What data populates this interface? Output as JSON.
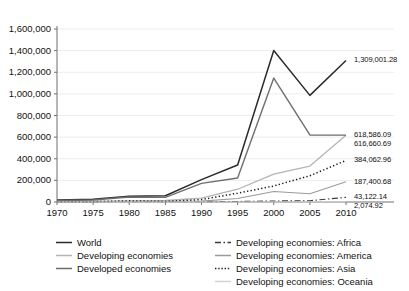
{
  "chart_data": {
    "type": "line",
    "title": "",
    "subtitle": "",
    "xlabel": "",
    "ylabel": "",
    "grid": true,
    "legend_position": "bottom",
    "x": [
      1970,
      1975,
      1980,
      1985,
      1990,
      1995,
      2000,
      2005,
      2010
    ],
    "xtick_labels": [
      "1970",
      "1975",
      "1980",
      "1985",
      "1990",
      "1995",
      "2000",
      "2005",
      "2010"
    ],
    "ylim": [
      0,
      1600000
    ],
    "ytick_labels": [
      "0",
      "200,000",
      "400,000",
      "600,000",
      "800,000",
      "1,000,000",
      "1,200,000",
      "1,400,000",
      "1,600,000"
    ],
    "ytick_values": [
      0,
      200000,
      400000,
      600000,
      800000,
      1000000,
      1200000,
      1400000,
      1600000
    ],
    "series": [
      {
        "name": "World",
        "style": "solid",
        "color": "#2b2b2b",
        "width": 1.5,
        "values": [
          18000,
          26000,
          54000,
          58000,
          207000,
          342000,
          1401000,
          986000,
          1309001.28
        ],
        "end_label": "1,309,001.28"
      },
      {
        "name": "Developing economies",
        "style": "solid",
        "color": "#b4b4b4",
        "width": 1.3,
        "values": [
          4000,
          7000,
          8000,
          14000,
          35000,
          118000,
          257000,
          332000,
          616660.69
        ],
        "end_label": "616,660.69"
      },
      {
        "name": "Developed economies",
        "style": "solid",
        "color": "#6e6e6e",
        "width": 1.4,
        "values": [
          14000,
          19000,
          46000,
          43000,
          172000,
          222000,
          1146000,
          620000,
          618586.09
        ],
        "end_label": "618,586.09"
      },
      {
        "name": "Developing economies: Africa",
        "style": "dashdot",
        "color": "#3a3a3a",
        "width": 1.1,
        "values": [
          1200,
          1600,
          2200,
          2400,
          3200,
          4800,
          9500,
          12000,
          43122.14
        ],
        "end_label": "43,122.14"
      },
      {
        "name": "Developing economies: America",
        "style": "solid",
        "color": "#9a9a9a",
        "width": 1.1,
        "values": [
          1600,
          2600,
          6300,
          6800,
          8500,
          32000,
          97000,
          76000,
          187400.68
        ],
        "end_label": "187,400.68"
      },
      {
        "name": "Developing economies: Asia",
        "style": "dotted",
        "color": "#1f1f1f",
        "width": 1.5,
        "values": [
          1500,
          2600,
          10500,
          5300,
          22500,
          81000,
          148000,
          243000,
          384062.96
        ],
        "end_label": "384,062.96"
      },
      {
        "name": "Developing economies: Oceania",
        "style": "solid",
        "color": "#d2d2d2",
        "width": 1.0,
        "values": [
          40,
          90,
          180,
          200,
          280,
          420,
          900,
          1200,
          2074.92
        ],
        "end_label": "2,074.92"
      }
    ],
    "point_labels": [
      {
        "text": "1,309,001.28",
        "series": "World"
      },
      {
        "text": "618,586.09",
        "series": "Developed economies"
      },
      {
        "text": "616,660.69",
        "series": "Developing economies"
      },
      {
        "text": "384,062.96",
        "series": "Developing economies: Asia"
      },
      {
        "text": "187,400.68",
        "series": "Developing economies: America"
      },
      {
        "text": "43,122.14",
        "series": "Developing economies: Africa"
      },
      {
        "text": "2,074.92",
        "series": "Developing economies: Oceania"
      }
    ]
  },
  "legend": {
    "left_column": [
      {
        "label": "World",
        "style": "solid",
        "color": "#2b2b2b"
      },
      {
        "label": "Developing economies",
        "style": "solid",
        "color": "#b4b4b4"
      },
      {
        "label": "Developed economies",
        "style": "solid",
        "color": "#6e6e6e"
      }
    ],
    "right_column": [
      {
        "label": "Developing economies: Africa",
        "style": "dashdot",
        "color": "#3a3a3a"
      },
      {
        "label": "Developing economies: America",
        "style": "solid",
        "color": "#9a9a9a"
      },
      {
        "label": "Developing economies: Asia",
        "style": "dotted",
        "color": "#1f1f1f"
      },
      {
        "label": "Developing economies: Oceania",
        "style": "solid",
        "color": "#d2d2d2"
      }
    ]
  },
  "axes": {
    "axis_color": "#6f6f6f",
    "grid_color": "#ededed"
  }
}
